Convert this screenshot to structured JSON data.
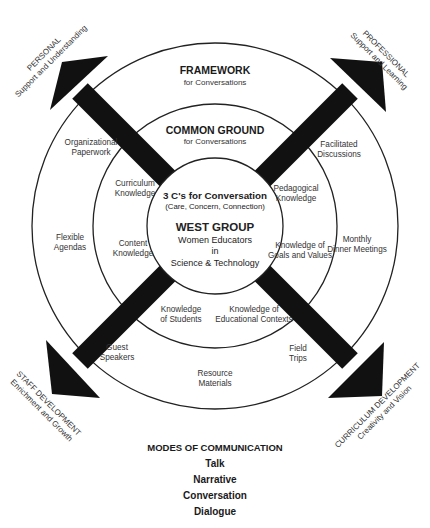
{
  "diagram": {
    "outer_ring": {
      "title": "FRAMEWORK",
      "subtitle": "for Conversations",
      "items": [
        "Organizational Paperwork",
        "Facilitated Discussions",
        "Flexible Agendas",
        "Monthly Dinner Meetings",
        "Guest Speakers",
        "Field Trips",
        "Resource Materials"
      ]
    },
    "middle_ring": {
      "title": "COMMON GROUND",
      "subtitle": "for Conversations",
      "items": [
        "Curriculum Knowledge",
        "Pedagogical Knowledge",
        "Content Knowledge",
        "Knowledge of Goals and Values",
        "Knowledge of Students",
        "Knowledge of Educational Contexts"
      ]
    },
    "core": {
      "title": "3 C's for Conversation",
      "subtitle": "(Care, Concern, Connection)",
      "group_name": "WEST GROUP",
      "group_line1": "Women Educators",
      "group_line2": "in",
      "group_line3": "Science & Technology"
    },
    "arrows": [
      {
        "direction": "up-left",
        "title": "PERSONAL",
        "subtitle": "Support and Understanding"
      },
      {
        "direction": "up-right",
        "title": "PROFESSIONAL",
        "subtitle": "Support and Learning"
      },
      {
        "direction": "down-left",
        "title": "STAFF DEVELOPMENT",
        "subtitle": "Enrichment and Growth"
      },
      {
        "direction": "down-right",
        "title": "CURRICULUM DEVELOPMENT",
        "subtitle": "Creativity and Vision"
      }
    ],
    "colors": {
      "arrow": "#111111",
      "ring_stroke": "#222222",
      "background": "#ffffff"
    }
  },
  "modes": {
    "title": "MODES OF COMMUNICATION",
    "items": [
      "Talk",
      "Narrative",
      "Conversation",
      "Dialogue"
    ]
  }
}
